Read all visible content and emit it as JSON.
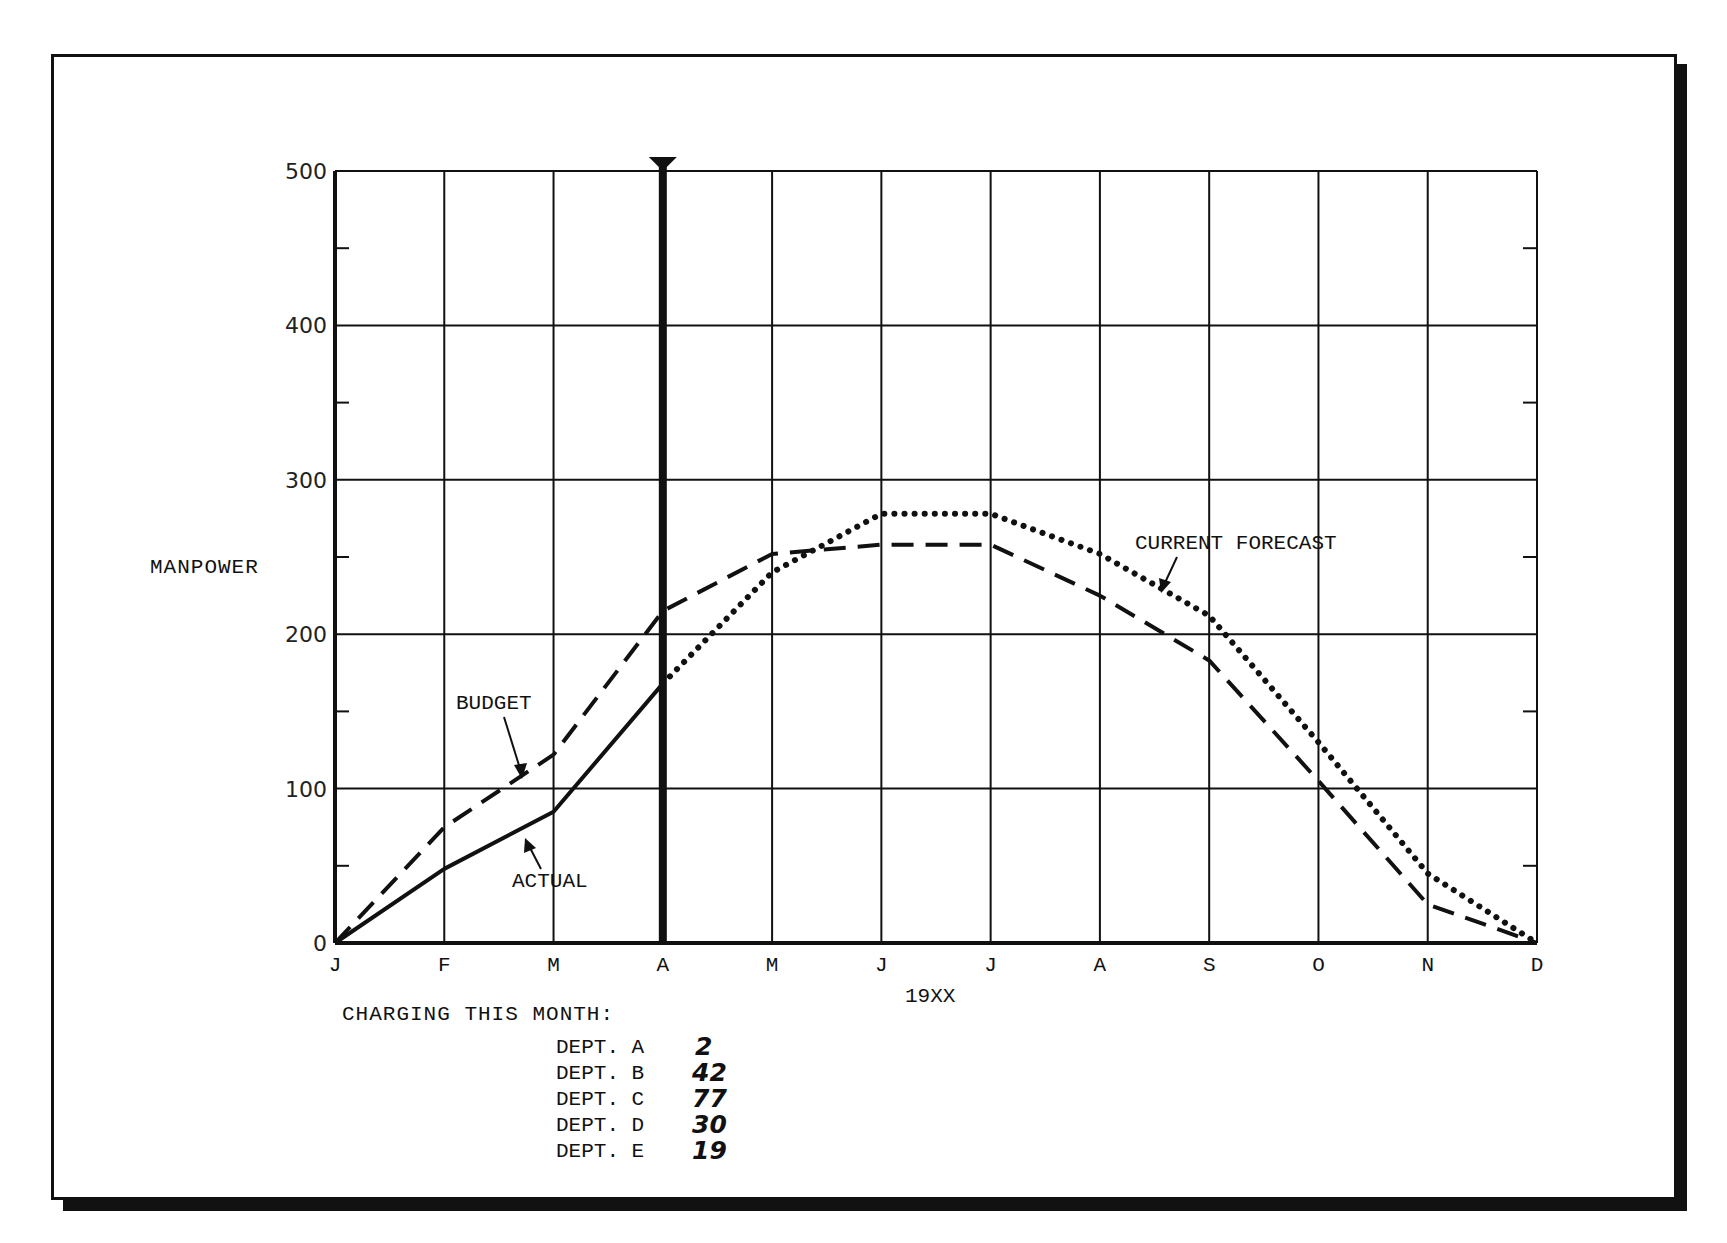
{
  "chart_data": {
    "type": "line",
    "title": "",
    "xlabel": "19XX",
    "ylabel": "MANPOWER",
    "ylim": [
      0,
      500
    ],
    "yticks": [
      0,
      100,
      200,
      300,
      400,
      500
    ],
    "categories": [
      "J",
      "F",
      "M",
      "A",
      "M",
      "J",
      "J",
      "A",
      "S",
      "O",
      "N",
      "D"
    ],
    "grid": true,
    "current_month_marker": "A",
    "series": [
      {
        "name": "BUDGET",
        "style": "dashed",
        "values": [
          0,
          75,
          122,
          215,
          252,
          258,
          258,
          225,
          183,
          105,
          25,
          0
        ]
      },
      {
        "name": "ACTUAL",
        "style": "solid",
        "values": [
          0,
          48,
          85,
          168,
          null,
          null,
          null,
          null,
          null,
          null,
          null,
          null
        ]
      },
      {
        "name": "CURRENT FORECAST",
        "style": "dotted",
        "values": [
          null,
          null,
          null,
          168,
          240,
          278,
          278,
          252,
          212,
          130,
          45,
          0
        ]
      }
    ],
    "annotations": [
      "BUDGET",
      "ACTUAL",
      "CURRENT FORECAST"
    ]
  },
  "axis": {
    "y_label": "MANPOWER",
    "x_title": "19XX",
    "y_ticks": [
      "500",
      "400",
      "300",
      "200",
      "100",
      "0"
    ],
    "x_ticks": [
      "J",
      "F",
      "M",
      "A",
      "M",
      "J",
      "J",
      "A",
      "S",
      "O",
      "N",
      "D"
    ]
  },
  "labels": {
    "budget": "BUDGET",
    "actual": "ACTUAL",
    "forecast": "CURRENT FORECAST"
  },
  "charging": {
    "title": "CHARGING THIS MONTH:",
    "rows": [
      {
        "dept": "DEPT. A",
        "value": "2"
      },
      {
        "dept": "DEPT. B",
        "value": "42"
      },
      {
        "dept": "DEPT. C",
        "value": "77"
      },
      {
        "dept": "DEPT. D",
        "value": "30"
      },
      {
        "dept": "DEPT. E",
        "value": "19"
      }
    ]
  },
  "colors": {
    "ink": "#111111",
    "paper": "#ffffff"
  }
}
